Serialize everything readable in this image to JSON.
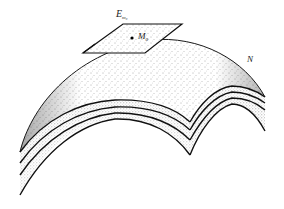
{
  "figure": {
    "labels": {
      "plane": {
        "main": "E",
        "sub": "m₀"
      },
      "point": {
        "main": "M",
        "sub": "0"
      },
      "surface": "N"
    },
    "colors": {
      "ink": "#1a1a1a",
      "background": "#ffffff",
      "shade": "#bdbdbd"
    },
    "layers": 4
  }
}
